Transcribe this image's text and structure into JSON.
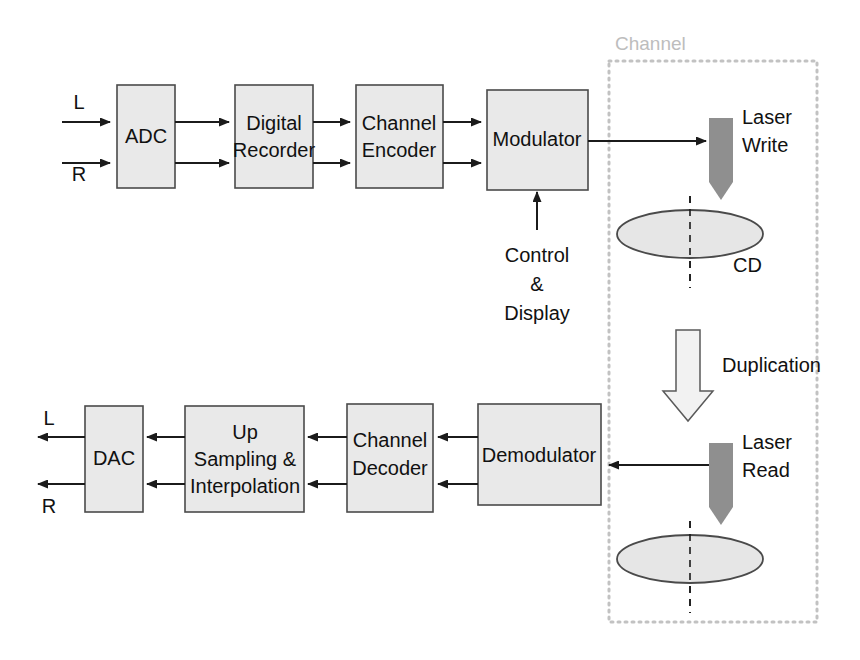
{
  "diagram": {
    "channel": {
      "label": "Channel"
    },
    "record_chain": {
      "inputs": [
        {
          "label": "L"
        },
        {
          "label": "R"
        }
      ],
      "blocks": [
        {
          "id": "adc",
          "lines": [
            "ADC"
          ]
        },
        {
          "id": "digital-recorder",
          "lines": [
            "Digital",
            "Recorder"
          ]
        },
        {
          "id": "channel-encoder",
          "lines": [
            "Channel",
            "Encoder"
          ]
        },
        {
          "id": "modulator",
          "lines": [
            "Modulator"
          ]
        }
      ],
      "control": {
        "lines": [
          "Control",
          "&",
          "Display"
        ]
      }
    },
    "playback_chain": {
      "outputs": [
        {
          "label": "L"
        },
        {
          "label": "R"
        }
      ],
      "blocks": [
        {
          "id": "dac",
          "lines": [
            "DAC"
          ]
        },
        {
          "id": "up-sampling-interpolation",
          "lines": [
            "Up",
            "Sampling &",
            "Interpolation"
          ]
        },
        {
          "id": "channel-decoder",
          "lines": [
            "Channel",
            "Decoder"
          ]
        },
        {
          "id": "demodulator",
          "lines": [
            "Demodulator"
          ]
        }
      ]
    },
    "media": {
      "laser_write": {
        "lines": [
          "Laser",
          "Write"
        ]
      },
      "laser_read": {
        "lines": [
          "Laser",
          "Read"
        ]
      },
      "cd_label": "CD",
      "duplication": "Duplication"
    },
    "colors": {
      "block_fill": "#e9e9e9",
      "block_stroke": "#4a4a4a",
      "wire": "#1b1b1b",
      "channel_border": "#c2c2c2",
      "channel_text": "#bdbdbd",
      "laser_fill": "#8f8f8f",
      "disc_fill": "#e6e6e6",
      "duplication_fill": "#f2f2f2"
    }
  }
}
